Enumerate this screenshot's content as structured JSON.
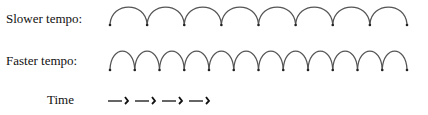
{
  "rows": [
    {
      "label": "Slower tempo:",
      "beats": 8
    },
    {
      "label": "Faster tempo:",
      "beats": 12
    }
  ],
  "time": {
    "label": "Time",
    "arrows": 4,
    "arrow_glyph": "—›"
  },
  "colors": {
    "arc": "#555555",
    "dot": "#222222",
    "text": "#111111"
  }
}
